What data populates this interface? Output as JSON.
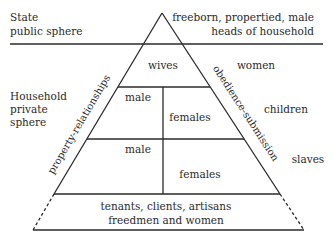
{
  "diagram": {
    "type": "social-hierarchy-pyramid",
    "left_labels": {
      "state": [
        "State",
        "public sphere"
      ],
      "household": [
        "Household",
        "private",
        "sphere"
      ]
    },
    "right_labels": {
      "top": [
        "freeborn, propertied, male",
        "heads of household"
      ],
      "women": "women",
      "children": "children",
      "slaves": "slaves"
    },
    "pyramid": {
      "wives": "wives",
      "upper_left": "male",
      "upper_right": "females",
      "lower_left": "male",
      "lower_right": "females",
      "base": [
        "tenants, clients, artisans",
        "freedmen and women"
      ]
    },
    "edge_labels": {
      "left": "property-relationships",
      "right": "obedience-submission"
    },
    "colors": {
      "line": "#2a2a2a",
      "text": "#2a2a2a",
      "background": "#ffffff"
    }
  }
}
